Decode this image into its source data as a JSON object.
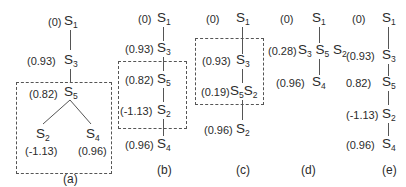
{
  "panels": {
    "a": {
      "caption": "(a)",
      "nodes": [
        {
          "id": "S1",
          "name": "S",
          "sub": "1",
          "value": "(0)"
        },
        {
          "id": "S3",
          "name": "S",
          "sub": "3",
          "value": "(0.93)"
        },
        {
          "id": "S5",
          "name": "S",
          "sub": "5",
          "value": "(0.82)"
        },
        {
          "id": "S2",
          "name": "S",
          "sub": "2",
          "value": "(-1.13)"
        },
        {
          "id": "S4",
          "name": "S",
          "sub": "4",
          "value": "(0.96)"
        }
      ]
    },
    "b": {
      "caption": "(b)",
      "nodes": [
        {
          "id": "S1",
          "name": "S",
          "sub": "1",
          "value": "(0)"
        },
        {
          "id": "S3",
          "name": "S",
          "sub": "3",
          "value": "(0.93)"
        },
        {
          "id": "S5",
          "name": "S",
          "sub": "5",
          "value": "(0.82)"
        },
        {
          "id": "S2",
          "name": "S",
          "sub": "2",
          "value": "(-1.13)"
        },
        {
          "id": "S4",
          "name": "S",
          "sub": "4",
          "value": "(0.96)"
        }
      ]
    },
    "c": {
      "caption": "(c)",
      "nodes": [
        {
          "id": "S1",
          "name": "S",
          "sub": "1",
          "value": "(0)"
        },
        {
          "id": "S3",
          "name": "S",
          "sub": "3",
          "value": "(0.93)"
        },
        {
          "id": "S5S2",
          "name": "S",
          "sub": "5",
          "name2": "S",
          "sub2": "2",
          "value": "(0.19)"
        },
        {
          "id": "S2",
          "name": "S",
          "sub": "2",
          "value": "(0.96)"
        }
      ]
    },
    "d": {
      "caption": "(d)",
      "nodes": [
        {
          "id": "S1",
          "name": "S",
          "sub": "1",
          "value": "(0)"
        },
        {
          "id": "S3S5S2",
          "name": "S",
          "sub": "3",
          "name2": "S",
          "sub2": "5",
          "name3": "S",
          "sub3": "2",
          "value": "(0.28)"
        },
        {
          "id": "S4",
          "name": "S",
          "sub": "4",
          "value": "(0.96)"
        }
      ]
    },
    "e": {
      "caption": "(e)",
      "nodes": [
        {
          "id": "S1",
          "name": "S",
          "sub": "1",
          "value": "(0)"
        },
        {
          "id": "S3",
          "name": "S",
          "sub": "3",
          "value": "(0.93)"
        },
        {
          "id": "S5",
          "name": "S",
          "sub": "5",
          "value": "0.82)"
        },
        {
          "id": "S2",
          "name": "S",
          "sub": "2",
          "value": "(-1.13)"
        },
        {
          "id": "S4",
          "name": "S",
          "sub": "4",
          "value": "(0.96)"
        }
      ]
    }
  }
}
